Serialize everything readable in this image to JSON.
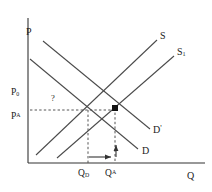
{
  "figure": {
    "type": "supply-demand-diagram",
    "background_color": "#ffffff",
    "line_color": "#3c3c3c",
    "axis_color": "#333333",
    "marker_color": "#111111"
  },
  "axes": {
    "y_axis_label": "P",
    "x_axis_label": "Q",
    "origin_px": {
      "x": 28,
      "y": 163
    }
  },
  "price_ticks": [
    {
      "id": "p0",
      "label_main": "P",
      "label_sub": "0",
      "y_px": 93
    },
    {
      "id": "pa",
      "label_main": "P",
      "label_sup": "A",
      "y_px": 117
    }
  ],
  "quantity_ticks": [
    {
      "id": "qd",
      "label_main": "Q",
      "label_sub": "D",
      "x_px": 88
    },
    {
      "id": "qa",
      "label_main": "Q",
      "label_sup": "A",
      "x_px": 115
    }
  ],
  "annotations": [
    {
      "id": "question-mark",
      "text": "?",
      "x_px": 52,
      "y_px": 99
    }
  ],
  "curves": [
    {
      "id": "supply",
      "label_main": "S",
      "kind": "supply",
      "slope": "upward",
      "label_x_px": 160,
      "label_y_px": 36,
      "x1": 36,
      "y1": 155,
      "x2": 157,
      "y2": 40
    },
    {
      "id": "supply-shifted",
      "label_main": "S",
      "label_sub": "1",
      "kind": "supply",
      "slope": "upward",
      "label_x_px": 177,
      "label_y_px": 52,
      "x1": 57,
      "y1": 158,
      "x2": 174,
      "y2": 56
    },
    {
      "id": "demand-shifted",
      "label_main": "D",
      "label_prime": "'",
      "kind": "demand",
      "slope": "downward",
      "label_x_px": 153,
      "label_y_px": 130,
      "x1": 43,
      "y1": 41,
      "x2": 150,
      "y2": 129
    },
    {
      "id": "demand",
      "label_main": "D",
      "kind": "demand",
      "slope": "downward",
      "label_x_px": 142,
      "label_y_px": 150,
      "x1": 30,
      "y1": 59,
      "x2": 138,
      "y2": 149
    }
  ],
  "equilibria": [
    {
      "id": "eq-initial",
      "marker": "none",
      "x_px": 88,
      "y_px": 110
    },
    {
      "id": "eq-final",
      "marker": "filled-square",
      "x_px": 115,
      "y_px": 108
    }
  ],
  "guide_lines": [
    {
      "id": "price-guide-horizontal",
      "style": "dashed",
      "x1": 30,
      "y1": 110,
      "x2": 115,
      "y2": 110
    },
    {
      "id": "qd-guide-vertical",
      "style": "dashed",
      "x1": 88,
      "y1": 110,
      "x2": 88,
      "y2": 163
    },
    {
      "id": "qa-guide-vertical",
      "style": "dashed",
      "x1": 115,
      "y1": 108,
      "x2": 115,
      "y2": 163
    }
  ],
  "shift_arrows": [
    {
      "id": "quantity-shift-arrow",
      "direction": "right",
      "x1": 89,
      "y1": 157,
      "x2": 113,
      "y2": 157
    },
    {
      "id": "price-shift-arrow",
      "direction": "up",
      "x1": 116,
      "y1": 157,
      "x2": 116,
      "y2": 143
    }
  ]
}
